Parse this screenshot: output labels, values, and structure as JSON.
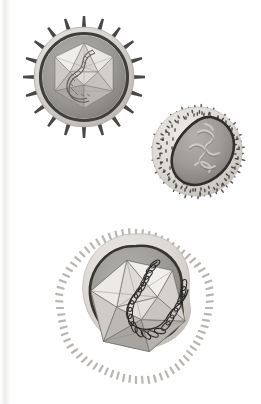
{
  "figure": {
    "title": "Virus particle structure illustration",
    "description": "Three stylized grayscale virus diagrams arranged diagonally on a white page",
    "background_color": "#ffffff",
    "width": 261,
    "height": 404,
    "page_gutter": {
      "name": "book-page-gutter-shadow",
      "visible": true,
      "side": "left",
      "width": 11,
      "color": "#ececeb"
    },
    "palette": {
      "envelope_light": "#d9d6d2",
      "envelope_mid": "#c3bfba",
      "membrane_dark": "#3f3f3e",
      "matrix_gray": "#9a9894",
      "capsid_light": "#e8e6e2",
      "capsid_mid": "#b6b2ad",
      "capsid_dark": "#8d8984",
      "genome_dark": "#2e2e2d",
      "spike_dark": "#4a4846",
      "outline": "#55534f"
    },
    "specimens": [
      {
        "id": "specimen-1",
        "name": "spiked-icosahedral-enveloped-virus",
        "label": "Enveloped icosahedral virus with radial surface spikes",
        "shape": "circular",
        "center": [
          84,
          77
        ],
        "radius": 50,
        "spike_count": 20,
        "spike_style": "tapered-rod",
        "has_envelope": true,
        "has_icosahedral_capsid": true,
        "genome": "coiled-helix",
        "capsid_radius": 34
      },
      {
        "id": "specimen-2",
        "name": "pleomorphic-fuzzy-enveloped-virus",
        "label": "Pleomorphic enveloped virus with dense fuzzy surface projections and kidney-shaped nucleocapsid",
        "shape": "rounded-irregular",
        "center": [
          198,
          152
        ],
        "radius": 45,
        "spike_count": 220,
        "spike_style": "fine-fuzz",
        "has_envelope": true,
        "has_icosahedral_capsid": false,
        "genome": "folded-strand",
        "core": "kidney-bean-nucleocapsid"
      },
      {
        "id": "specimen-3",
        "name": "large-amoeboid-icosahedral-virus",
        "label": "Large pleomorphic virus with comb-like surface fringe, icosahedral core and prominent coiled genome",
        "shape": "amoeboid",
        "center": [
          136,
          308
        ],
        "radius": 74,
        "spike_count": 96,
        "spike_style": "comb-tooth",
        "has_envelope": true,
        "has_icosahedral_capsid": true,
        "genome": "double-coiled-helix",
        "capsid_radius": 47
      }
    ]
  }
}
